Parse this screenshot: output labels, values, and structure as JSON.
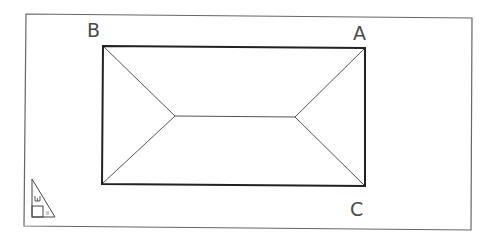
{
  "diagram": {
    "type": "hip-roof-plan",
    "labels": {
      "a": "A",
      "b": "B",
      "c": "C"
    },
    "ucs_icon": {
      "name": "ucs-paper-space-icon",
      "glyph": "W"
    },
    "colors": {
      "line": "#333333",
      "frame": "#555555",
      "label": "#4a4a4a",
      "background": "#ffffff"
    }
  }
}
